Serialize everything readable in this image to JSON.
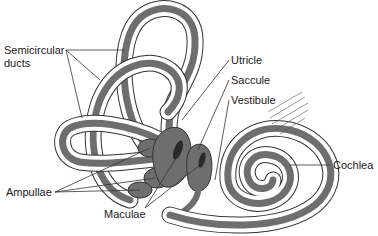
{
  "diagram": {
    "colors": {
      "endolymph_duct": "#6e6e6e",
      "macula": "#2a2a2a",
      "outline": "#333333",
      "background": "#ffffff",
      "leader_line": "#333333"
    },
    "labels": {
      "semicircular_line1": "Semicircular",
      "semicircular_line2": "ducts",
      "utricle": "Utricle",
      "saccule": "Saccule",
      "vestibule": "Vestibule",
      "cochlea": "Cochlea",
      "ampullae": "Ampullae",
      "maculae": "Maculae"
    }
  }
}
